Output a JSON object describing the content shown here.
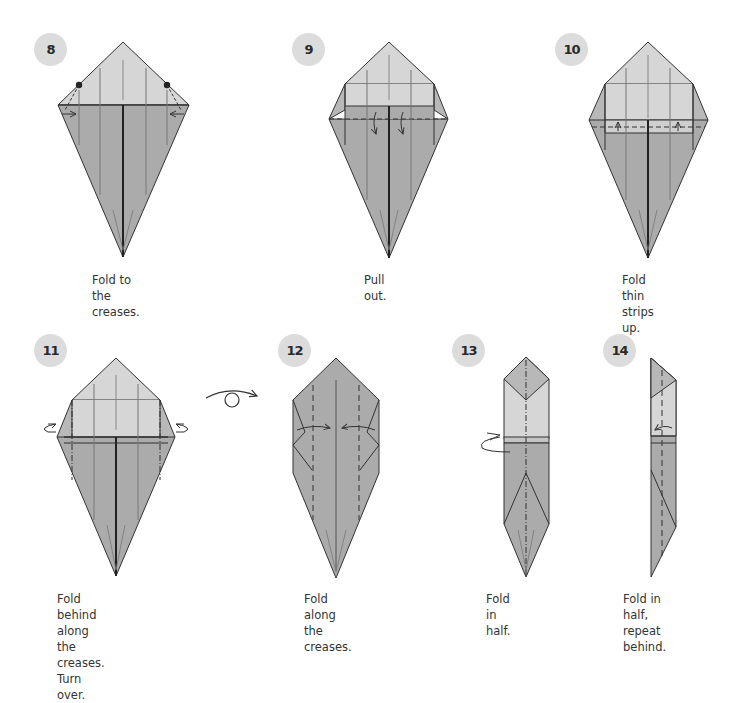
{
  "steps": [
    {
      "number": "8",
      "caption": "Fold to the\ncreases."
    },
    {
      "number": "9",
      "caption": "Pull out."
    },
    {
      "number": "10",
      "caption": "Fold thin\nstrips up."
    },
    {
      "number": "11",
      "caption": "Fold behind along the\ncreases. Turn over."
    },
    {
      "number": "12",
      "caption": "Fold along\nthe creases."
    },
    {
      "number": "13",
      "caption": "Fold in half."
    },
    {
      "number": "14",
      "caption": "Fold in half,\nrepeat behind."
    }
  ],
  "colors": {
    "paper_light": "#d6d6d6",
    "paper_dark": "#ababab",
    "line": "#333333",
    "badge_bg": "#dcdcdc"
  },
  "symbols": {
    "turn_over": "turn-over-symbol"
  }
}
